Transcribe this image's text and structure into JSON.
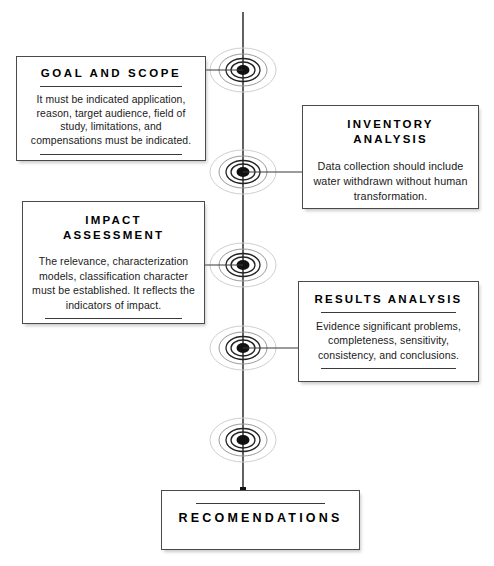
{
  "diagram": {
    "title_implicit": "Life Cycle Assessment phases flow diagram",
    "axis": {
      "orientation": "vertical",
      "node_count": 5,
      "node_icon": "concentric-circles-node-icon"
    },
    "boxes": [
      {
        "id": "goal",
        "title": "GOAL AND SCOPE",
        "body": "It must be indicated application, reason, target audience, field of study, limitations, and compensations must be indicated.",
        "side": "left",
        "rule_above_body": true,
        "rule_below_body": true
      },
      {
        "id": "inventory",
        "title": "INVENTORY\nANALYSIS",
        "body": "Data collection should include water withdrawn without human transformation.",
        "side": "right",
        "rule_above_body": false,
        "rule_below_body": false
      },
      {
        "id": "impact",
        "title": "IMPACT\nASSESSMENT",
        "body": "The relevance, characterization models, classification character must be established. It reflects the indicators of impact.",
        "side": "left",
        "rule_above_body": false,
        "rule_below_body": true
      },
      {
        "id": "results",
        "title": "RESULTS ANALYSIS",
        "body": "Evidence significant problems, completeness, sensitivity, consistency, and conclusions.",
        "side": "right",
        "rule_above_body": true,
        "rule_below_body": true
      },
      {
        "id": "recommendations",
        "title": "RECOMENDATIONS",
        "body": "",
        "side": "bottom",
        "rule_above_body": true,
        "rule_below_body": false
      }
    ],
    "colors": {
      "line": "#3a3a3a",
      "node_core": "#111111",
      "node_halo": "#bdbdbd",
      "box_border": "#4a4a4a",
      "background": "#ffffff",
      "text": "#111111"
    }
  }
}
